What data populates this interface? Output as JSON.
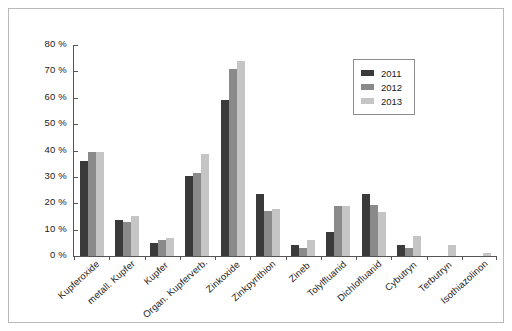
{
  "chart_data": {
    "type": "bar",
    "title": "",
    "xlabel": "",
    "ylabel": "",
    "ylim": [
      0,
      80
    ],
    "ytick_labels": [
      "80 %",
      "70 %",
      "60 %",
      "50 %",
      "40 %",
      "30 %",
      "20 %",
      "10 %",
      "0 %"
    ],
    "ytick_values": [
      80,
      70,
      60,
      50,
      40,
      30,
      20,
      10,
      0
    ],
    "grid": false,
    "legend_position": "top-right",
    "categories": [
      "Kupferoxide",
      "metall. Kupfer",
      "Kupfer",
      "Organ. Kupferverb.",
      "Zinkoxide",
      "Zinkpyrithion",
      "Zineb",
      "Tolylfluanid",
      "Dichlofluanid",
      "Cybutryn",
      "Terbutryn",
      "Isothiazolinon"
    ],
    "series": [
      {
        "name": "2011",
        "color": "#3a3a3a",
        "values": [
          36,
          13.5,
          5,
          30.5,
          59,
          23.5,
          4,
          9,
          23.5,
          4,
          0,
          0
        ]
      },
      {
        "name": "2012",
        "color": "#8a8a8a",
        "values": [
          39.5,
          13,
          6,
          31.5,
          71,
          17,
          3,
          19,
          19.5,
          3,
          0,
          0
        ]
      },
      {
        "name": "2013",
        "color": "#c5c5c5",
        "values": [
          39.5,
          15,
          7,
          38.5,
          74,
          18,
          6,
          19,
          16.5,
          7.5,
          4,
          1
        ]
      }
    ]
  },
  "legend": {
    "entries": [
      {
        "label": "2011",
        "color": "#3a3a3a"
      },
      {
        "label": "2012",
        "color": "#8a8a8a"
      },
      {
        "label": "2013",
        "color": "#c5c5c5"
      }
    ]
  }
}
